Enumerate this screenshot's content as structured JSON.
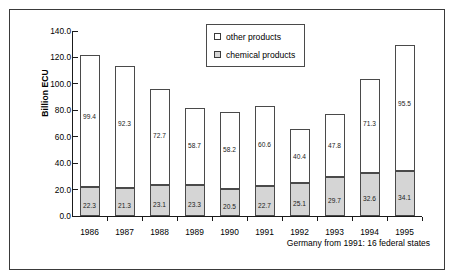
{
  "chart_data": {
    "type": "bar",
    "subtype": "stacked",
    "title": "",
    "xlabel": "",
    "ylabel": "Billion ECU",
    "ylim": [
      0,
      140
    ],
    "ytick_step": 20,
    "yticks": [
      "0.0",
      "20.0",
      "40.0",
      "60.0",
      "80.0",
      "100.0",
      "120.0",
      "140.0"
    ],
    "grid": false,
    "legend_position": "top-center",
    "categories": [
      "1986",
      "1987",
      "1988",
      "1989",
      "1990",
      "1991",
      "1992",
      "1993",
      "1994",
      "1995"
    ],
    "series": [
      {
        "name": "chemical products",
        "color": "#d5d5d5",
        "values": [
          22.3,
          21.3,
          23.1,
          23.3,
          20.5,
          22.7,
          25.1,
          29.7,
          32.6,
          34.1
        ],
        "labels": [
          "22.3",
          "21.3",
          "23.1",
          "23.3",
          "20.5",
          "22.7",
          "25.1",
          "29.7",
          "32.6",
          "34.1"
        ]
      },
      {
        "name": "other products",
        "color": "#ffffff",
        "values": [
          99.4,
          92.3,
          72.7,
          58.7,
          58.2,
          60.6,
          40.4,
          47.8,
          71.3,
          95.5
        ],
        "labels": [
          "99.4",
          "92.3",
          "72.7",
          "58.7",
          "58.2",
          "60.6",
          "40.4",
          "47.8",
          "71.3",
          "95.5"
        ]
      }
    ],
    "totals": [
      121.7,
      113.6,
      95.8,
      82.0,
      78.7,
      83.3,
      65.5,
      77.5,
      103.9,
      129.6
    ],
    "annotation": "Germany from 1991: 16 federal states"
  },
  "legend": {
    "items": [
      {
        "label": "other products",
        "swatch": "white-square-icon"
      },
      {
        "label": "chemical products",
        "swatch": "gray-square-icon"
      }
    ]
  },
  "footnote": "Germany from 1991: 16 federal states"
}
